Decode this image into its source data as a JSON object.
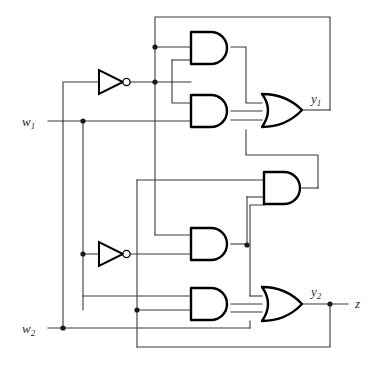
{
  "diagram": {
    "type": "logic-circuit-schematic",
    "background_color": "#ffffff",
    "wire_color": "#3a3a3a",
    "gate_color": "#000000"
  },
  "labels": {
    "input_w1": "w",
    "input_w1_sub": "1",
    "input_w2": "w",
    "input_w2_sub": "2",
    "output_y1": "y",
    "output_y1_sub": "1",
    "output_y2": "y",
    "output_y2_sub": "2",
    "output_z": "z"
  },
  "inputs": [
    {
      "name": "w1",
      "label": "w",
      "subscript": "1",
      "y": 121
    },
    {
      "name": "w2",
      "label": "w",
      "subscript": "2",
      "y": 328
    }
  ],
  "outputs": [
    {
      "name": "y1",
      "label": "y",
      "subscript": "1",
      "x": 312,
      "y": 101
    },
    {
      "name": "y2",
      "label": "y",
      "subscript": "2",
      "x": 312,
      "y": 294
    },
    {
      "name": "z",
      "label": "z",
      "subscript": "",
      "x": 357,
      "y": 304
    }
  ],
  "gates": [
    {
      "id": "and1",
      "type": "AND",
      "inputs": 2,
      "x": 191,
      "y": 32,
      "w": 40,
      "h": 32
    },
    {
      "id": "and2",
      "type": "AND",
      "inputs": 2,
      "x": 191,
      "y": 95,
      "w": 40,
      "h": 32
    },
    {
      "id": "and3",
      "type": "AND",
      "inputs": 2,
      "x": 264,
      "y": 172,
      "w": 38,
      "h": 32
    },
    {
      "id": "and4",
      "type": "AND",
      "inputs": 2,
      "x": 191,
      "y": 228,
      "w": 40,
      "h": 32
    },
    {
      "id": "and5",
      "type": "AND",
      "inputs": 2,
      "x": 191,
      "y": 288,
      "w": 40,
      "h": 32
    },
    {
      "id": "or1",
      "type": "OR",
      "inputs": 2,
      "x": 262,
      "y": 95,
      "w": 40,
      "h": 33,
      "output": "y1"
    },
    {
      "id": "or2",
      "type": "OR",
      "inputs": 2,
      "x": 262,
      "y": 288,
      "w": 40,
      "h": 33,
      "output": "y2"
    },
    {
      "id": "not1",
      "type": "NOT",
      "inputs": 1,
      "x": 99,
      "y": 82
    },
    {
      "id": "not2",
      "type": "NOT",
      "inputs": 1,
      "x": 99,
      "y": 254
    }
  ],
  "junction_dots": [
    {
      "x": 155,
      "y": 47
    },
    {
      "x": 155,
      "y": 82
    },
    {
      "x": 83,
      "y": 121
    },
    {
      "x": 83,
      "y": 254
    },
    {
      "x": 247,
      "y": 245
    },
    {
      "x": 137,
      "y": 310
    },
    {
      "x": 63,
      "y": 328
    },
    {
      "x": 330,
      "y": 304
    }
  ]
}
